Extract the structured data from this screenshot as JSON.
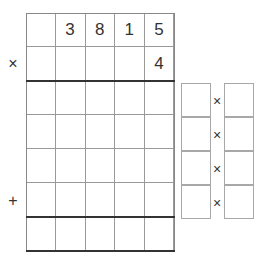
{
  "multiplication": {
    "operator_times": "×",
    "operator_plus": "+",
    "multiplicand_row": [
      "",
      "3",
      "8",
      "1",
      "5"
    ],
    "multiplier_row": [
      "",
      "",
      "",
      "",
      "4"
    ],
    "partial_rows": [
      [
        "",
        "",
        "",
        "",
        ""
      ],
      [
        "",
        "",
        "",
        "",
        ""
      ],
      [
        "",
        "",
        "",
        "",
        ""
      ],
      [
        "",
        "",
        "",
        "",
        ""
      ]
    ],
    "result_row": [
      "",
      "",
      "",
      "",
      ""
    ]
  },
  "side_factors": {
    "times_symbol": "×",
    "rows": [
      {
        "left": "",
        "right": ""
      },
      {
        "left": "",
        "right": ""
      },
      {
        "left": "",
        "right": ""
      },
      {
        "left": "",
        "right": ""
      }
    ]
  },
  "colors": {
    "grid_line": "#9a9a9a",
    "thick_line": "#333333",
    "text": "#333333"
  }
}
